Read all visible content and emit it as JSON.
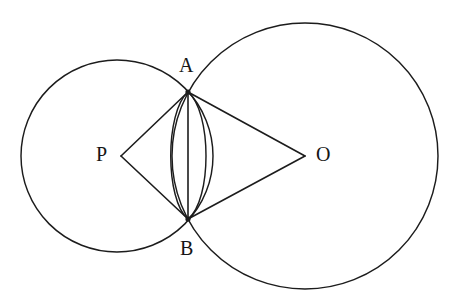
{
  "figure": {
    "type": "geometry-diagram",
    "canvas": {
      "width": 464,
      "height": 304,
      "background": "#ffffff"
    },
    "stroke_color": "#1c1c1c",
    "label_color": "#151515"
  },
  "points": [
    {
      "id": "A",
      "label": "A",
      "x": 188,
      "y": 92,
      "label_x": 179,
      "label_y": 55,
      "role": "upper-intersection"
    },
    {
      "id": "B",
      "label": "B",
      "x": 188,
      "y": 219,
      "label_x": 180,
      "label_y": 238,
      "role": "lower-intersection"
    },
    {
      "id": "P",
      "label": "P",
      "x": 121,
      "y": 156,
      "label_x": 96,
      "label_y": 144,
      "role": "left-circle-center"
    },
    {
      "id": "O",
      "label": "O",
      "x": 305,
      "y": 156,
      "label_x": 316,
      "label_y": 144,
      "role": "right-circle-center"
    }
  ],
  "circles": [
    {
      "id": "circle-P",
      "center": "P",
      "cx": 117,
      "cy": 156,
      "r": 96,
      "name": "left-circle"
    },
    {
      "id": "circle-O",
      "center": "O",
      "cx": 305,
      "cy": 156,
      "r": 133,
      "name": "right-circle"
    }
  ],
  "arcs": [
    {
      "id": "arc-left",
      "name": "left-lens-arc",
      "d": "M 188 92 C 165 112 165 200 188 219",
      "note": "arc of right circle between A and B, bulging left"
    },
    {
      "id": "arc-right",
      "name": "right-lens-arc",
      "d": "M 188 92 C 212 112 212 200 188 219",
      "note": "arc of left circle between A and B, bulging right"
    }
  ],
  "segments": [
    {
      "id": "PA",
      "name": "segment-p-a",
      "from": "P",
      "to": "A",
      "x1": 121,
      "y1": 156,
      "x2": 188,
      "y2": 92
    },
    {
      "id": "PB",
      "name": "segment-p-b",
      "from": "P",
      "to": "B",
      "x1": 121,
      "y1": 156,
      "x2": 188,
      "y2": 219
    },
    {
      "id": "OA",
      "name": "segment-o-a",
      "from": "O",
      "to": "A",
      "x1": 305,
      "y1": 156,
      "x2": 188,
      "y2": 92
    },
    {
      "id": "OB",
      "name": "segment-o-b",
      "from": "O",
      "to": "B",
      "x1": 305,
      "y1": 156,
      "x2": 188,
      "y2": 219
    },
    {
      "id": "AB",
      "name": "segment-a-b",
      "from": "A",
      "to": "B",
      "x1": 188,
      "y1": 92,
      "x2": 188,
      "y2": 219
    }
  ]
}
